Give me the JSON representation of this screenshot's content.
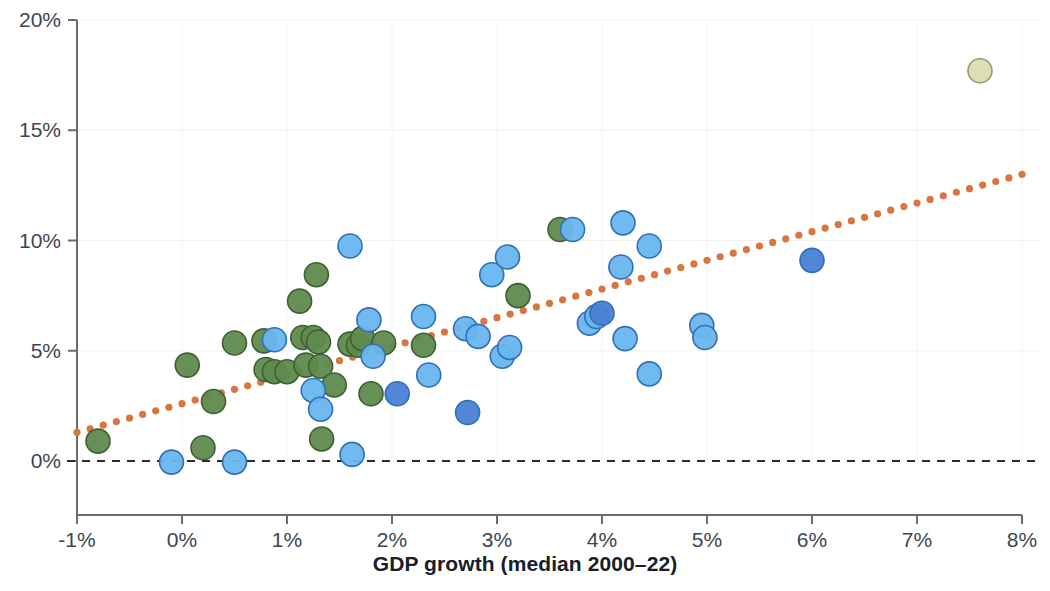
{
  "chart_data": {
    "type": "scatter",
    "title": "",
    "xlabel": "GDP growth (median 2000–22)",
    "ylabel": "",
    "xlim": [
      -1,
      8
    ],
    "ylim": [
      0,
      20
    ],
    "xticks": [
      "-1%",
      "0%",
      "1%",
      "2%",
      "3%",
      "4%",
      "5%",
      "6%",
      "7%",
      "8%"
    ],
    "xtick_values": [
      -1,
      0,
      1,
      2,
      3,
      4,
      5,
      6,
      7,
      8
    ],
    "yticks": [
      "0%",
      "5%",
      "10%",
      "15%",
      "20%"
    ],
    "ytick_values": [
      0,
      5,
      10,
      15,
      20
    ],
    "grid": "faint vertical and horizontal gridlines",
    "legend": "none",
    "zero_line": {
      "y": 0,
      "style": "dashed",
      "color": "#2b2b2b"
    },
    "trendline": {
      "type": "linear",
      "style": "dotted",
      "color": "#d9763f",
      "x_start": -1.0,
      "y_start": 1.3,
      "x_end": 8.0,
      "y_end": 13.0
    },
    "marker_colors": {
      "green": "#5f8a4e",
      "light_blue": "#68b6ef",
      "dark_blue": "#4a7fd4",
      "khaki": "#dcdcb0"
    },
    "series": [
      {
        "name": "green",
        "color": "#5f8a4e",
        "points": [
          [
            -0.8,
            0.9
          ],
          [
            0.2,
            0.6
          ],
          [
            0.3,
            2.7
          ],
          [
            0.05,
            4.35
          ],
          [
            0.5,
            5.35
          ],
          [
            0.78,
            5.45
          ],
          [
            0.8,
            4.15
          ],
          [
            0.88,
            4.05
          ],
          [
            1.0,
            4.05
          ],
          [
            1.12,
            7.25
          ],
          [
            1.15,
            5.6
          ],
          [
            1.18,
            4.35
          ],
          [
            1.25,
            5.6
          ],
          [
            1.28,
            8.45
          ],
          [
            1.3,
            5.4
          ],
          [
            1.32,
            4.3
          ],
          [
            1.33,
            1.0
          ],
          [
            1.45,
            3.45
          ],
          [
            1.6,
            5.3
          ],
          [
            1.68,
            5.25
          ],
          [
            1.72,
            5.55
          ],
          [
            1.8,
            3.05
          ],
          [
            1.92,
            5.35
          ],
          [
            2.3,
            5.25
          ],
          [
            3.2,
            7.5
          ],
          [
            3.6,
            10.5
          ]
        ]
      },
      {
        "name": "light_blue",
        "color": "#68b6ef",
        "points": [
          [
            -0.1,
            -0.05
          ],
          [
            0.5,
            -0.05
          ],
          [
            0.88,
            5.5
          ],
          [
            1.25,
            3.2
          ],
          [
            1.32,
            2.35
          ],
          [
            1.62,
            0.3
          ],
          [
            1.6,
            9.75
          ],
          [
            1.78,
            6.4
          ],
          [
            1.82,
            4.75
          ],
          [
            2.3,
            6.55
          ],
          [
            2.35,
            3.9
          ],
          [
            2.7,
            6.0
          ],
          [
            2.82,
            5.65
          ],
          [
            2.95,
            8.45
          ],
          [
            3.05,
            4.75
          ],
          [
            3.1,
            9.25
          ],
          [
            3.12,
            5.15
          ],
          [
            3.72,
            10.5
          ],
          [
            3.88,
            6.25
          ],
          [
            4.2,
            10.8
          ],
          [
            4.18,
            8.8
          ],
          [
            4.22,
            5.55
          ],
          [
            4.45,
            9.75
          ],
          [
            4.45,
            3.95
          ],
          [
            4.95,
            6.15
          ],
          [
            4.98,
            5.6
          ],
          [
            3.95,
            6.55
          ]
        ]
      },
      {
        "name": "dark_blue",
        "color": "#4a7fd4",
        "points": [
          [
            2.05,
            3.05
          ],
          [
            2.72,
            2.2
          ],
          [
            4.0,
            6.7
          ],
          [
            6.0,
            9.1
          ]
        ]
      },
      {
        "name": "khaki",
        "color": "#dcdcb0",
        "points": [
          [
            7.6,
            17.7
          ]
        ]
      }
    ]
  }
}
